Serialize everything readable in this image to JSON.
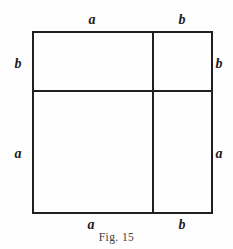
{
  "figure": {
    "caption": "Fig. 15",
    "type": "geometric-diagram",
    "colors": {
      "line": "#231f20",
      "label": "#1b1b1b",
      "caption": "#3d3d3d",
      "background": "#fefefe"
    },
    "labels": {
      "top_left": "a",
      "top_right": "b",
      "left_upper": "b",
      "left_lower": "a",
      "right_upper": "b",
      "right_lower": "a",
      "bottom_left": "a",
      "bottom_right": "b"
    }
  },
  "chart_data": {
    "type": "diagram",
    "title": "Fig. 15",
    "shape": "square",
    "outer_square": {
      "x": 32,
      "y": 31,
      "width": 181,
      "height": 183
    },
    "dividers": {
      "vertical_x": 152,
      "horizontal_y": 90
    },
    "segments": {
      "top": [
        {
          "label": "a",
          "from_x": 32,
          "to_x": 152
        },
        {
          "label": "b",
          "from_x": 152,
          "to_x": 213
        }
      ],
      "bottom": [
        {
          "label": "a",
          "from_x": 32,
          "to_x": 152
        },
        {
          "label": "b",
          "from_x": 152,
          "to_x": 213
        }
      ],
      "left": [
        {
          "label": "b",
          "from_y": 31,
          "to_y": 90
        },
        {
          "label": "a",
          "from_y": 90,
          "to_y": 214
        }
      ],
      "right": [
        {
          "label": "b",
          "from_y": 31,
          "to_y": 90
        },
        {
          "label": "a",
          "from_y": 90,
          "to_y": 214
        }
      ]
    },
    "regions": [
      {
        "name": "top-left",
        "width_label": "a",
        "height_label": "b",
        "area_label": "ab"
      },
      {
        "name": "top-right",
        "width_label": "b",
        "height_label": "b",
        "area_label": "b²"
      },
      {
        "name": "bottom-left",
        "width_label": "a",
        "height_label": "a",
        "area_label": "a²"
      },
      {
        "name": "bottom-right",
        "width_label": "b",
        "height_label": "a",
        "area_label": "ab"
      }
    ]
  }
}
